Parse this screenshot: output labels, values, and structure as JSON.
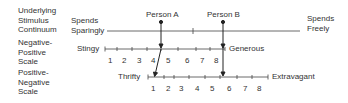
{
  "row_labels": {
    "continuum": [
      "Underlying",
      "Stimulus",
      "Continuum"
    ],
    "neg_pos": [
      "Negative-",
      "Positive",
      "Scale"
    ],
    "pos_neg": [
      "Positive-",
      "Negative",
      "Scale"
    ]
  },
  "continuum": {
    "left_end": [
      "Spends",
      "Sparingly"
    ],
    "right_end": [
      "Spends",
      "Freely"
    ]
  },
  "persons": {
    "a": "Person A",
    "b": "Person B"
  },
  "neg_pos_scale": {
    "left_end": "Stingy",
    "right_end": "Generous",
    "ticks": [
      "1",
      "2",
      "3",
      "4",
      "5",
      "6",
      "7",
      "8"
    ],
    "person_a_rating": 4.5,
    "person_b_rating": 8.5
  },
  "pos_neg_scale": {
    "left_end": "Thrifty",
    "right_end": "Extravagant",
    "ticks": [
      "1",
      "2",
      "3",
      "4",
      "5",
      "6",
      "7",
      "8"
    ],
    "person_a_rating": 1.5,
    "person_b_rating": 5.5
  }
}
